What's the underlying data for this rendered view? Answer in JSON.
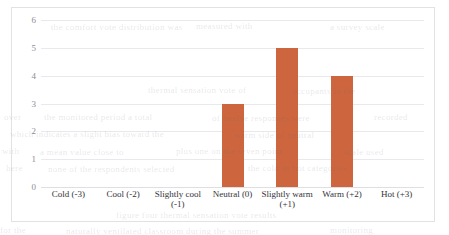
{
  "chart_data": {
    "type": "bar",
    "title": "",
    "subtitle": "",
    "xlabel": "",
    "ylabel": "",
    "categories": [
      "Cold (-3)",
      "Cool (-2)",
      "Slightly cool (-1)",
      "Neutral (0)",
      "Slightly warm (+1)",
      "Warm (+2)",
      "Hot (+3)"
    ],
    "values": [
      0,
      0,
      0,
      3,
      5,
      4,
      0
    ],
    "ylim": [
      0,
      6
    ],
    "ytick_labels": [
      "6",
      "5",
      "4",
      "3",
      "2",
      "1",
      "0"
    ],
    "ytick_values": [
      6,
      5,
      4,
      3,
      2,
      1,
      0
    ],
    "grid": true,
    "legend": false,
    "legend_position": "none",
    "bar_color": "#CD653E",
    "gridline_color": "#E9E9ED",
    "frame_color": "#E2E2E6",
    "axis_text_color": "#8D8D93"
  },
  "axis_labels": {
    "cat_0": "Cold (-3)",
    "cat_1": "Cool (-2)",
    "cat_2": "Slightly cool (-1)",
    "cat_3": "Neutral (0)",
    "cat_4": "Slightly warm (+1)",
    "cat_5": "Warm (+2)",
    "cat_6": "Hot (+3)",
    "y_6": "6",
    "y_5": "5",
    "y_4": "4",
    "y_3": "3",
    "y_2": "2",
    "y_1": "1",
    "y_0": "0"
  }
}
